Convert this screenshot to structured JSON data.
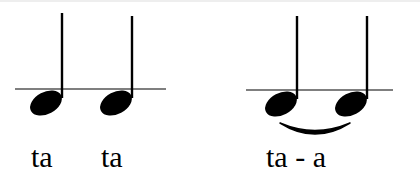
{
  "figure": {
    "colors": {
      "ink": "#000000",
      "background": "#ffffff"
    }
  },
  "left_group": {
    "notes": [
      {
        "type": "quarter-note",
        "stem_direction": "up"
      },
      {
        "type": "quarter-note",
        "stem_direction": "up"
      }
    ],
    "labels": [
      "ta",
      "ta"
    ]
  },
  "right_group": {
    "notes": [
      {
        "type": "quarter-note",
        "stem_direction": "up"
      },
      {
        "type": "quarter-note",
        "stem_direction": "up"
      }
    ],
    "tie": true,
    "label": "ta - a"
  }
}
